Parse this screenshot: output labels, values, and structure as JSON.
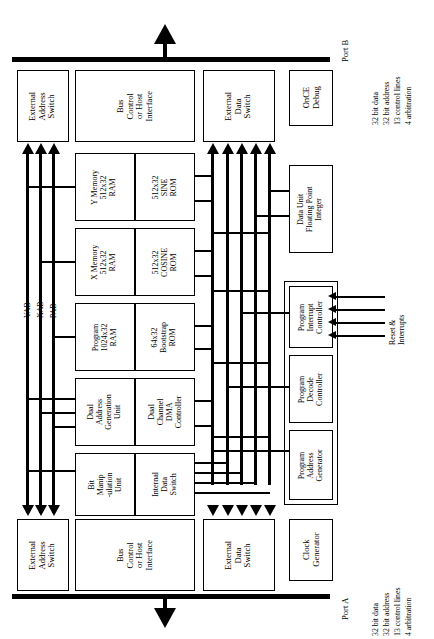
{
  "diagram": {
    "ports": {
      "port_b": {
        "label": "Port B",
        "specs": [
          "32 bit data",
          "32 bit address",
          "13 control lines",
          "4 arbitration"
        ]
      },
      "port_a": {
        "label": "Port A",
        "specs": [
          "32 bit data",
          "32 bit address",
          "13 control lines",
          "4 arbitration"
        ]
      }
    },
    "buses": {
      "yab": "YAB",
      "xab": "XAB",
      "pab": "PAB"
    },
    "signals": {
      "reset_interrupts": "Reset &\nInterrupts"
    },
    "blocks": {
      "ext_addr_switch_top": "External\nAddress\nSwitch",
      "bus_control_top": "Bus\nControl\nor Host\nInterface",
      "ext_data_switch_top": "External\nData\nSwitch",
      "once_debug": "OnCE\nDebug",
      "y_memory_ram": "Y Memory\n512x32\nRAM",
      "sine_rom": "512x32\nSINE\nROM",
      "x_memory_ram": "X Memory\n512x32\nRAM",
      "cosine_rom": "512x32\nCOSINE\nROM",
      "program_ram": "Program\n1024x32\nRAM",
      "bootstrap_rom": "64x32\nBootstrap\nROM",
      "dual_address_gen": "Dual\nAddress\nGeneration\nUnit",
      "dual_dma": "Dual\nChannel\nDMA\nController",
      "bit_manipulation": "Bit\nManip\n-ulation\nUnit",
      "internal_data_switch": "Internal\nData\nSwitch",
      "data_unit": "Data Unit\nFloating Point\nInteger",
      "prog_interrupt_ctrl": "Program\nInterrupt\nController",
      "prog_decode_ctrl": "Program\nDecode\nController",
      "prog_addr_gen": "Program\nAddress\nGenerator",
      "ext_addr_switch_bot": "External\nAddress\nSwitch",
      "bus_control_bot": "Bus\nControl\nor Host\nInterface",
      "ext_data_switch_bot": "External\nData\nSwitch",
      "clock_generator": "Clock\nGenerator"
    },
    "colors": {
      "stroke": "#000000",
      "background": "#ffffff"
    }
  }
}
